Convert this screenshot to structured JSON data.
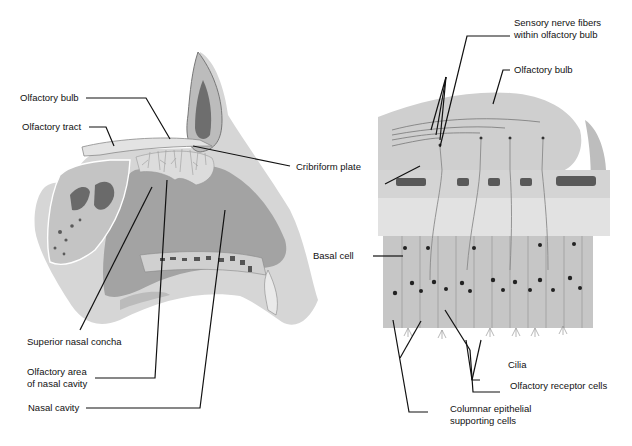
{
  "figure": {
    "left_panel": {
      "name": "Sagittal section of nasal cavity",
      "labels": {
        "olfactory_bulb": "Olfactory bulb",
        "olfactory_tract": "Olfactory tract",
        "superior_nasal_concha": "Superior nasal concha",
        "olfactory_area_line1": "Olfactory area",
        "olfactory_area_line2": "of nasal cavity",
        "nasal_cavity": "Nasal cavity"
      }
    },
    "center_label": {
      "cribriform_plate": "Cribriform plate"
    },
    "right_panel": {
      "name": "Olfactory epithelium detail",
      "labels": {
        "sensory_fibers_line1": "Sensory nerve fibers",
        "sensory_fibers_line2": "within olfactory bulb",
        "olfactory_bulb": "Olfactory bulb",
        "basal_cell": "Basal cell",
        "cilia": "Cilia",
        "olfactory_receptor_cells": "Olfactory receptor cells",
        "columnar_line1": "Columnar epithelial",
        "columnar_line2": "supporting cells"
      }
    },
    "colors": {
      "tissue_light": "#d9d9d9",
      "tissue_mid": "#bdbdbd",
      "tissue_dark": "#8f8f8f",
      "bone_dark": "#555555",
      "leader_line": "#111111"
    }
  }
}
